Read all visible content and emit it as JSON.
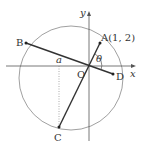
{
  "figure": {
    "points": {
      "A": {
        "label": "A(1, 2)"
      },
      "B": {
        "label": "B"
      },
      "C": {
        "label": "C"
      },
      "D": {
        "label": "D"
      },
      "O": {
        "label": "O"
      }
    },
    "axes": {
      "x_label": "x",
      "y_label": "y"
    },
    "angle_label": "θ",
    "a_label": "a",
    "colors": {
      "circle": "#888888",
      "segment": "#333333",
      "axis": "#555555",
      "dotted": "#888888"
    }
  }
}
